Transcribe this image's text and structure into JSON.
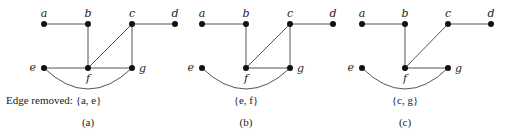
{
  "panels": [
    {
      "id": "a",
      "caption": "Edge removed: {a, e}",
      "sub_label": "(a)",
      "removed_edge": [
        "a",
        "e"
      ],
      "nodes": {
        "a": [
          44,
          24
        ],
        "b": [
          88,
          24
        ],
        "c": [
          132,
          24
        ],
        "d": [
          175,
          24
        ],
        "e": [
          44,
          68
        ],
        "f": [
          88,
          68
        ],
        "g": [
          132,
          68
        ]
      },
      "edges": [
        [
          "a",
          "b"
        ],
        [
          "c",
          "d"
        ],
        [
          "b",
          "f"
        ],
        [
          "c",
          "f"
        ],
        [
          "c",
          "g"
        ],
        [
          "e",
          "f"
        ],
        [
          "f",
          "g"
        ]
      ],
      "arcs": [
        [
          "e",
          "g"
        ]
      ]
    },
    {
      "id": "b",
      "caption": "{e, f}",
      "sub_label": "(b)",
      "removed_edge": [
        "e",
        "f"
      ],
      "nodes": {
        "a": [
          202,
          24
        ],
        "b": [
          246,
          24
        ],
        "c": [
          290,
          24
        ],
        "d": [
          333,
          24
        ],
        "e": [
          202,
          68
        ],
        "f": [
          246,
          68
        ],
        "g": [
          290,
          68
        ]
      },
      "edges": [
        [
          "a",
          "b"
        ],
        [
          "c",
          "d"
        ],
        [
          "b",
          "f"
        ],
        [
          "c",
          "f"
        ],
        [
          "c",
          "g"
        ],
        [
          "f",
          "g"
        ]
      ],
      "arcs": [
        [
          "e",
          "g"
        ]
      ]
    },
    {
      "id": "c",
      "caption": "{c, g}",
      "sub_label": "(c)",
      "removed_edge": [
        "c",
        "g"
      ],
      "nodes": {
        "a": [
          362,
          24
        ],
        "b": [
          405,
          24
        ],
        "c": [
          448,
          24
        ],
        "d": [
          491,
          24
        ],
        "e": [
          362,
          68
        ],
        "f": [
          405,
          68
        ],
        "g": [
          448,
          68
        ]
      },
      "edges": [
        [
          "a",
          "b"
        ],
        [
          "c",
          "d"
        ],
        [
          "b",
          "f"
        ],
        [
          "c",
          "f"
        ],
        [
          "f",
          "g"
        ]
      ],
      "arcs": [
        [
          "e",
          "g"
        ]
      ]
    }
  ],
  "colors": {
    "edge": "#555555",
    "node": "#111111",
    "text": "#222222"
  }
}
